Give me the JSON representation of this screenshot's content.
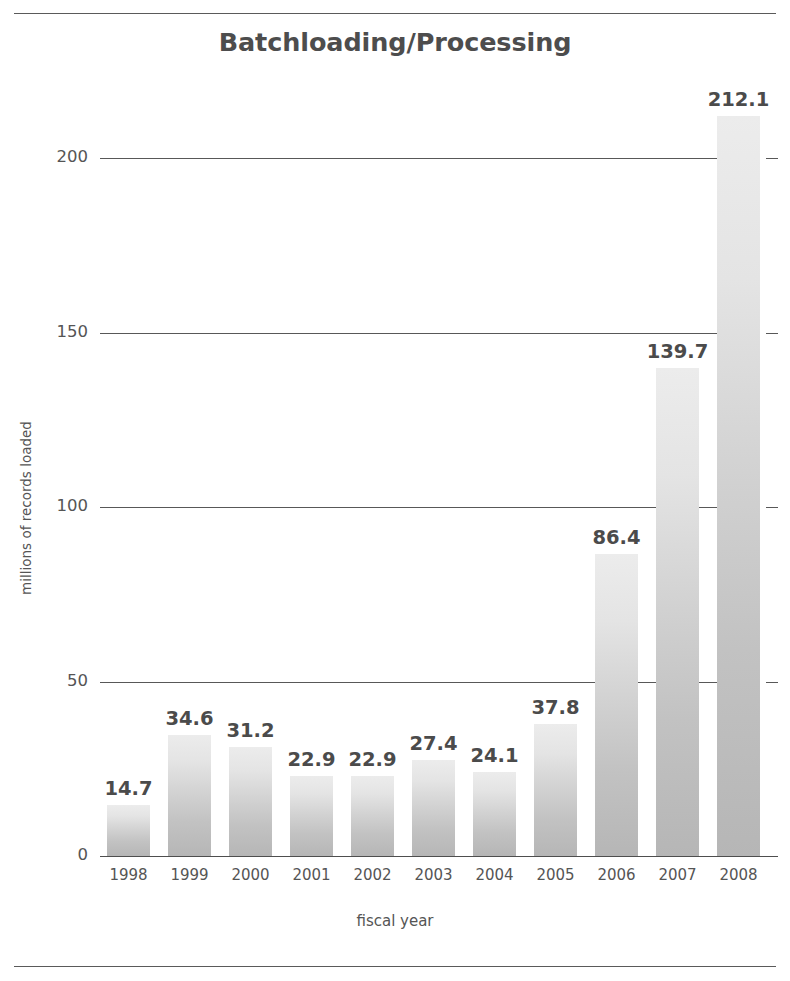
{
  "page": {
    "running_head": "",
    "rules": {
      "color": "#5a5a5a"
    }
  },
  "chart_data": {
    "type": "bar",
    "title": "Batchloading/Processing",
    "xlabel": "fiscal year",
    "ylabel": "millions of records loaded",
    "categories": [
      "1998",
      "1999",
      "2000",
      "2001",
      "2002",
      "2003",
      "2004",
      "2005",
      "2006",
      "2007",
      "2008"
    ],
    "values": [
      14.7,
      34.6,
      31.2,
      22.9,
      22.9,
      27.4,
      24.1,
      37.8,
      86.4,
      139.7,
      212.1
    ],
    "value_labels": [
      "14.7",
      "34.6",
      "31.2",
      "22.9",
      "22.9",
      "27.4",
      "24.1",
      "37.8",
      "86.4",
      "139.7",
      "212.1"
    ],
    "ylim": [
      0,
      200
    ],
    "yticks": [
      0,
      50,
      100,
      150,
      200
    ],
    "ytick_labels": [
      "0",
      "50",
      "100",
      "150",
      "200"
    ],
    "grid": true,
    "legend": false,
    "bar_color_top": "#ececec",
    "bar_color_bottom": "#b6b6b6",
    "text_color": "#4b4b4b",
    "axis_color": "#585858"
  }
}
